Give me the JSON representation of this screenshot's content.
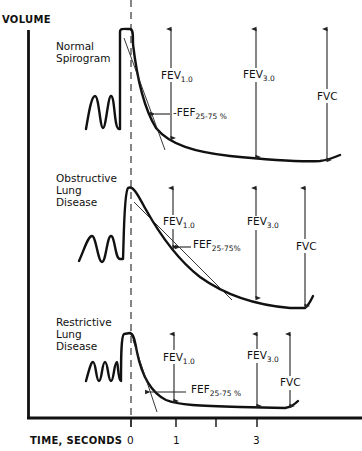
{
  "figure": {
    "y_axis_label": "VOLUME",
    "x_axis_label": "TIME, SECONDS",
    "x_ticks": [
      {
        "label": "0",
        "x": 131,
        "show_label": true
      },
      {
        "label": "1",
        "x": 176,
        "show_label": true
      },
      {
        "label": "",
        "x": 216,
        "show_label": false
      },
      {
        "label": "3",
        "x": 257,
        "show_label": true
      }
    ],
    "colors": {
      "ink": "#111111",
      "background": "#ffffff"
    }
  },
  "panels": [
    {
      "id": "normal",
      "title_lines": [
        "Normal",
        "Spirogram"
      ],
      "fev1_label": "FEV",
      "fev1_sub": "1.0",
      "fev3_label": "FEV",
      "fev3_sub": "3.0",
      "fvc_label": "FVC",
      "fef_label": "FEF",
      "fef_sub": "25-75 %"
    },
    {
      "id": "obstructive",
      "title_lines": [
        "Obstructive",
        "Lung",
        "Disease"
      ],
      "fev1_label": "FEV",
      "fev1_sub": "1.0",
      "fev3_label": "FEV",
      "fev3_sub": "3.0",
      "fvc_label": "FVC",
      "fef_label": "FEF",
      "fef_sub": "25-75%"
    },
    {
      "id": "restrictive",
      "title_lines": [
        "Restrictive",
        "Lung",
        "Disease"
      ],
      "fev1_label": "FEV",
      "fev1_sub": "1.0",
      "fev3_label": "FEV",
      "fev3_sub": "3.0",
      "fvc_label": "FVC",
      "fef_label": "FEF",
      "fef_sub": "25-75 %"
    }
  ]
}
